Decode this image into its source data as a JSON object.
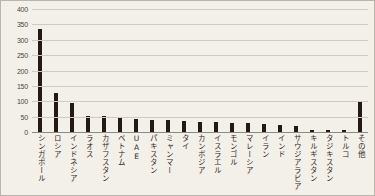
{
  "chart_data": {
    "type": "bar",
    "title": "",
    "xlabel": "",
    "ylabel": "",
    "ylim": [
      0,
      400
    ],
    "yticks": [
      0,
      50,
      100,
      150,
      200,
      250,
      300,
      350,
      400
    ],
    "grid": true,
    "legend": "none",
    "bar_color": "#241a14",
    "grid_color": "#cfcac1",
    "background_color": "#f3f0ea",
    "categories": [
      "シンガポール",
      "ロシア",
      "インドネシア",
      "ラオス",
      "カザフスタン",
      "ベトナム",
      "UAE",
      "パキスタン",
      "ミャンマー",
      "タイ",
      "カンボジア",
      "イスラエル",
      "モンゴル",
      "マレーシア",
      "イラン",
      "インド",
      "サウジアラビア",
      "キルギスタン",
      "タジキスタン",
      "トルコ",
      "その他"
    ],
    "values": [
      335,
      128,
      95,
      52,
      51,
      44,
      43,
      40,
      38,
      35,
      33,
      31,
      29,
      28,
      26,
      24,
      20,
      8,
      7,
      6,
      97
    ]
  }
}
